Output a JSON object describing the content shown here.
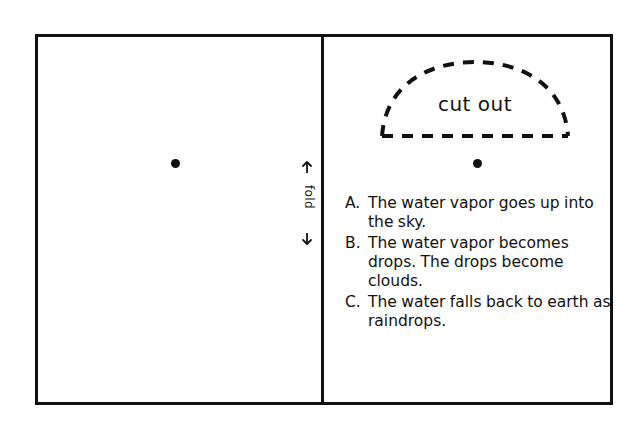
{
  "worksheet": {
    "fold_label": "fold",
    "cut_out_label": "cut out",
    "left_panel_name": "blank drawing panel",
    "right_panel_name": "instructions panel"
  },
  "instructions": [
    {
      "letter": "A.",
      "text": "The water vapor goes up into the sky."
    },
    {
      "letter": "B.",
      "text": "The water vapor becomes drops. The drops become clouds."
    },
    {
      "letter": "C.",
      "text": "The water falls back to earth as raindrops."
    }
  ],
  "icons": {
    "fold_arrow_up": "arrow-up-icon",
    "fold_arrow_down": "arrow-down-icon",
    "dot_left": "registration-dot-icon",
    "dot_right": "registration-dot-icon"
  },
  "colors": {
    "ink": "#111111",
    "paper": "#ffffff"
  }
}
